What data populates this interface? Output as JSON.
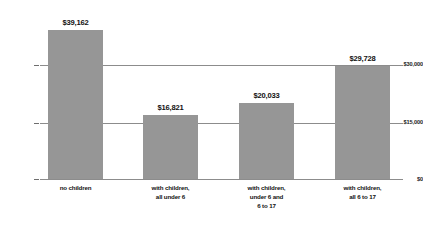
{
  "chart_data": {
    "type": "bar",
    "title": "",
    "subtitle": "",
    "xlabel": "",
    "ylabel": "",
    "categories": [
      "no children",
      "with children, all under 6",
      "with children, under 6 and 6 to 17",
      "with children, all 6 to 17"
    ],
    "category_lines": [
      [
        "no children"
      ],
      [
        "with children,",
        "all under 6"
      ],
      [
        "with children,",
        "under 6 and",
        "6 to 17"
      ],
      [
        "with children,",
        "all 6 to 17"
      ]
    ],
    "values": [
      39162,
      16821,
      20033,
      29728
    ],
    "value_labels": [
      "$39,162",
      "$16,821",
      "$20,033",
      "$29,728"
    ],
    "ylim": [
      0,
      45000
    ],
    "yticks": [
      0,
      15000,
      30000
    ],
    "ytick_labels": [
      "$0",
      "$15,000",
      "$30,000"
    ],
    "grid": true,
    "legend": "none",
    "bar_color": "#969696",
    "axis_color": "#8c8c8c",
    "text_color": "#111111"
  }
}
